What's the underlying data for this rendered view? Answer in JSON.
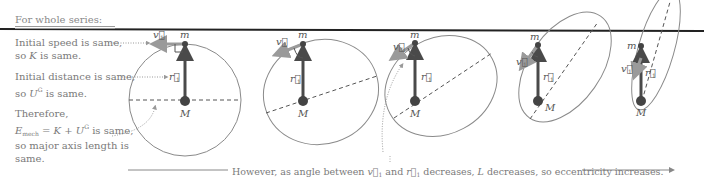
{
  "heading": "For whole series:",
  "notes": {
    "speed_line1": "Initial speed is same,",
    "speed_line2_pre": "so ",
    "speed_var": "K",
    "speed_line2_post": " is same.",
    "distance_line1": "Initial distance is same,",
    "distance_line2_pre": "so ",
    "distance_var": "U",
    "distance_sup": "G",
    "distance_line2_post": " is same.",
    "therefore": "Therefore,",
    "energy_var": "E",
    "energy_sub": "mech",
    "energy_eq": " = K + U",
    "energy_sup": "G",
    "energy_post": " is same,",
    "axis_line1": "so major axis length is",
    "axis_line2": "same."
  },
  "labels": {
    "small_mass": "m",
    "large_mass": "M",
    "velocity": "v⃗",
    "velocity_sub": "1",
    "radius": "r⃗",
    "radius_sub": "1"
  },
  "caption": {
    "pre": "However, as angle between ",
    "v": "v⃗",
    "v_sub": "1",
    "mid": " and ",
    "r": "r⃗",
    "r_sub": "1",
    "post_pre": " decreases, ",
    "L": "L",
    "post": " decreases, so eccentricity increases."
  },
  "colors": {
    "orbit": "#8a8a8a",
    "radius_arrow": "#4a4a4a",
    "velocity_arrow": "#9a9a9a",
    "top_rule": "#222222",
    "text": "#7a7a7a"
  },
  "orbits": [
    {
      "name": "circular",
      "m": [
        185,
        44
      ],
      "M": [
        185,
        101
      ]
    },
    {
      "name": "slightly-eccentric",
      "m": [
        303,
        44
      ],
      "M": [
        303,
        101
      ]
    },
    {
      "name": "moderately-eccentric",
      "m": [
        415,
        43
      ],
      "M": [
        415,
        101
      ]
    },
    {
      "name": "eccentric",
      "m": [
        538,
        45
      ],
      "M": [
        538,
        101
      ]
    },
    {
      "name": "highly-eccentric",
      "m": [
        641,
        46
      ],
      "M": [
        641,
        101
      ]
    }
  ]
}
